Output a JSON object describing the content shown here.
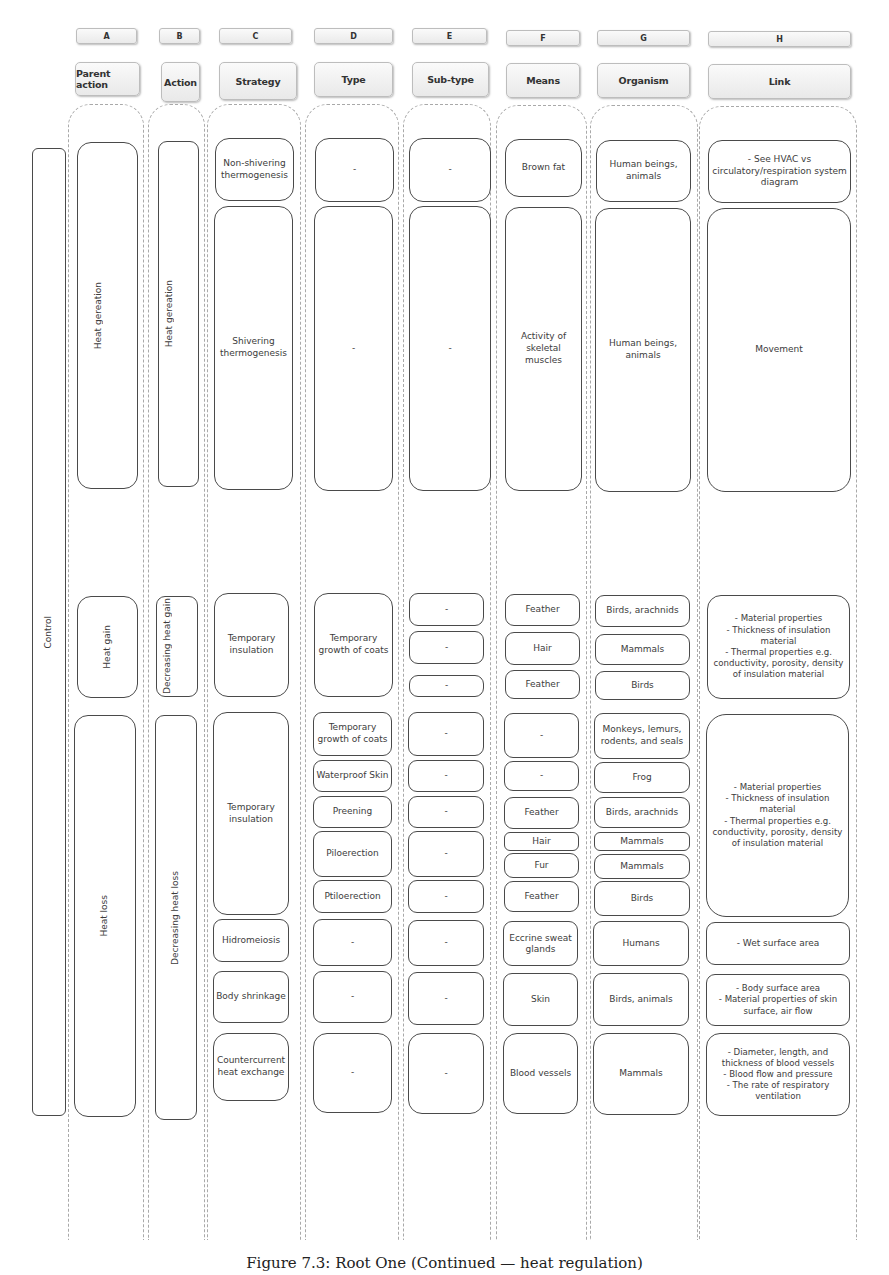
{
  "columns": [
    {
      "letter": "A",
      "title": "Parent action"
    },
    {
      "letter": "B",
      "title": "Action"
    },
    {
      "letter": "C",
      "title": "Strategy"
    },
    {
      "letter": "D",
      "title": "Type"
    },
    {
      "letter": "E",
      "title": "Sub-type"
    },
    {
      "letter": "F",
      "title": "Means"
    },
    {
      "letter": "G",
      "title": "Organism"
    },
    {
      "letter": "H",
      "title": "Link"
    }
  ],
  "control": "Control",
  "parent_actions": [
    "Heat gereation",
    "Heat gain",
    "Heat loss"
  ],
  "actions": [
    "Heat gereation",
    "Decreasing heat gain",
    "Decreasing heat loss"
  ],
  "heat_generation": {
    "rows": [
      {
        "strategy": "Non-shivering thermogenesis",
        "type": "-",
        "subtype": "-",
        "means": "Brown fat",
        "organism": "Human beings, animals",
        "link": "- See HVAC vs circulatory/respiration system diagram"
      },
      {
        "strategy": "Shivering thermogenesis",
        "type": "-",
        "subtype": "-",
        "means": "Activity of skeletal muscles",
        "organism": "Human beings, animals",
        "link": "Movement"
      }
    ]
  },
  "heat_gain": {
    "strategy": "Temporary insulation",
    "type": "Temporary growth of coats",
    "subtypes": [
      "-",
      "-",
      "-"
    ],
    "means": [
      "Feather",
      "Hair",
      "Feather"
    ],
    "organisms": [
      "Birds, arachnids",
      "Mammals",
      "Birds"
    ],
    "link": "- Material properties\n- Thickness of insulation material\n- Thermal properties e.g. conductivity, porosity, density of insulation material"
  },
  "heat_loss": {
    "insulation": {
      "strategy": "Temporary insulation",
      "types": [
        "Temporary growth of coats",
        "Waterproof Skin",
        "Preening",
        "Piloerection",
        "Ptiloerection"
      ],
      "subtypes": [
        "-",
        "-",
        "-",
        "-",
        "-"
      ],
      "means": [
        "-",
        "-",
        "Feather",
        "Hair",
        "Fur",
        "Feather"
      ],
      "organisms": [
        "Monkeys, lemurs, rodents, and seals",
        "Frog",
        "Birds, arachnids",
        "Mammals",
        "Mammals",
        "Birds"
      ],
      "link": "- Material properties\n- Thickness of insulation material\n- Thermal properties e.g. conductivity, porosity, density of insulation material"
    },
    "rows": [
      {
        "strategy": "Hidromeiosis",
        "type": "-",
        "subtype": "-",
        "means": "Eccrine sweat glands",
        "organism": "Humans",
        "link": "- Wet surface area"
      },
      {
        "strategy": "Body shrinkage",
        "type": "-",
        "subtype": "-",
        "means": "Skin",
        "organism": "Birds, animals",
        "link": "- Body surface area\n- Material properties of skin surface, air flow"
      },
      {
        "strategy": "Countercurrent heat exchange",
        "type": "-",
        "subtype": "-",
        "means": "Blood vessels",
        "organism": "Mammals",
        "link": "- Diameter, length, and thickness of blood vessels\n- Blood flow and pressure\n- The rate of respiratory ventilation"
      }
    ]
  },
  "caption": "Figure 7.3: Root One (Continued — heat regulation)"
}
